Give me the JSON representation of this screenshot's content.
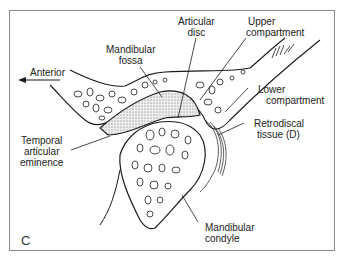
{
  "figure": {
    "panel_letter": "C",
    "labels": {
      "mandibular_fossa": [
        "Mandibular",
        "fossa"
      ],
      "articular_disc": [
        "Articular",
        "disc"
      ],
      "upper_compartment": [
        "Upper",
        "compartment"
      ],
      "anterior": "Anterior",
      "lower_compartment": [
        "Lower",
        "compartment"
      ],
      "retrodiscal_tissue": [
        "Retrodiscal",
        "tissue (D)"
      ],
      "temporal_articular_eminence": [
        "Temporal",
        "articular",
        "eminence"
      ],
      "mandibular_condyle": [
        "Mandibular",
        "condyle"
      ]
    },
    "colors": {
      "line": "#1a1a1a",
      "frame": "#8a8a8a",
      "disc_fill": "#d8d8d8",
      "background": "#ffffff"
    }
  }
}
